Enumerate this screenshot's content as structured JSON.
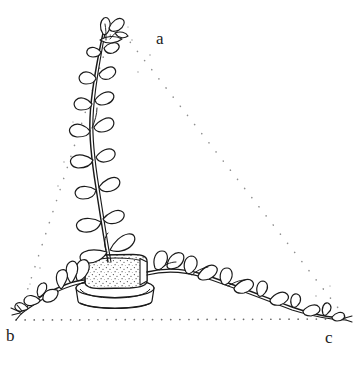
{
  "figure": {
    "kind": "botanical-line-drawing",
    "background_color": "#ffffff",
    "ink_color": "#1a1a1a",
    "dot_color": "#9a9a9a",
    "stipple_color": "#4a4a4a",
    "top_text_remnant": "· ·",
    "labels": [
      {
        "id": "a",
        "text": "a",
        "role": "apex-vertex-label"
      },
      {
        "id": "b",
        "text": "b",
        "role": "bottom-left-vertex-label"
      },
      {
        "id": "c",
        "text": "c",
        "role": "bottom-right-vertex-label"
      }
    ],
    "guide_triangle": {
      "style": "dotted",
      "vertices": {
        "a": {
          "x": 114,
          "y": 24
        },
        "b": {
          "x": 18,
          "y": 319
        },
        "c": {
          "x": 346,
          "y": 318
        }
      },
      "edges": [
        "a-b",
        "a-c",
        "b-c"
      ]
    },
    "planter": {
      "soil_block": {
        "x": 84,
        "y": 256,
        "width": 62,
        "height": 30,
        "fill": "stippled"
      },
      "saucer": {
        "x": 76,
        "y": 285,
        "width": 78,
        "height": 22
      }
    },
    "shoots": [
      {
        "name": "vertical-shoot",
        "from": "pot",
        "to": "a",
        "leaf_count": 9
      },
      {
        "name": "left-shoot",
        "from": "pot",
        "to": "b",
        "leaf_count": 6
      },
      {
        "name": "right-shoot",
        "from": "pot",
        "to": "c",
        "leaf_count": 11
      }
    ]
  }
}
